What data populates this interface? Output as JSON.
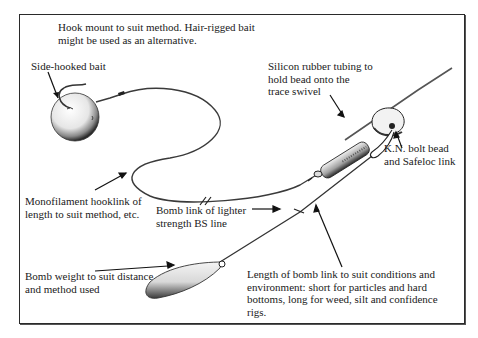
{
  "diagram": {
    "type": "fishing rig illustration",
    "labels": {
      "hook_mount": "Hook mount to suit method. Hair-rigged bait\nmight be used as an alternative.",
      "side_hooked_bait": "Side-hooked bait",
      "silicon_tubing": "Silicon rubber tubing to\nhold bead onto the\ntrace swivel",
      "kn_bolt_bead": "K.N. bolt bead\nand Safeloc link",
      "monofilament": "Monofilament hooklink of\nlength to suit method, etc.",
      "bomb_link": "Bomb link of lighter\nstrength BS line",
      "bomb_weight": "Bomb weight to suit distance\nand method used",
      "bomb_link_length": "Length of bomb link to suit conditions and\nenvironment: short for particles and hard\nbottoms, long for weed, silt and confidence\nrigs."
    },
    "components": [
      "bait-ball",
      "hook",
      "hooklink",
      "swivel",
      "silicon-tubing",
      "bolt-bead",
      "safeloc-link",
      "main-line",
      "bomb-link",
      "bomb-weight"
    ],
    "colors": {
      "ink": "#1a1a1a",
      "background": "#ffffff"
    }
  }
}
